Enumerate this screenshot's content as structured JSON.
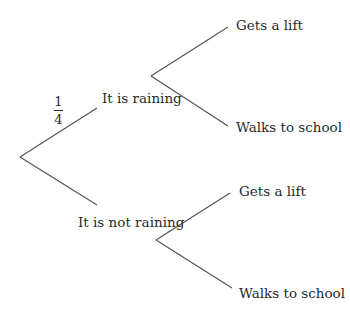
{
  "diagram": {
    "type": "probability-tree",
    "root": {
      "branches": [
        {
          "label": "It is raining",
          "probability": "1/4",
          "probability_numerator": "1",
          "probability_denominator": "4",
          "branches": [
            {
              "label": "Gets a lift"
            },
            {
              "label": "Walks to school"
            }
          ]
        },
        {
          "label": "It is not raining",
          "probability": "",
          "branches": [
            {
              "label": "Gets a lift"
            },
            {
              "label": "Walks to school"
            }
          ]
        }
      ]
    },
    "colors": {
      "line": "#555555",
      "text": "#2a2a2a",
      "background": "#ffffff"
    }
  }
}
